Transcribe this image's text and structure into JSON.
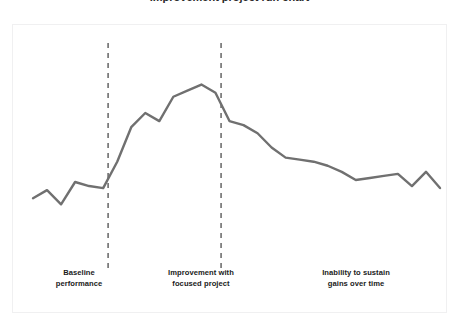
{
  "figure": {
    "background_color": "#ffffff",
    "panel_border_color": "#f0f0f1",
    "clipped_title": "Improvement project run chart"
  },
  "chart_data": {
    "type": "line",
    "title": "",
    "xlabel": "",
    "ylabel": "",
    "grid": false,
    "legend": false,
    "line_color": "#707070",
    "line_width": 2.4,
    "xlim": [
      0,
      29
    ],
    "ylim": [
      0,
      10
    ],
    "x": [
      0,
      1,
      2,
      3,
      4,
      5,
      6,
      7,
      8,
      9,
      10,
      11,
      12,
      13,
      14,
      15,
      16,
      17,
      18,
      19,
      20,
      21,
      22,
      23,
      24,
      25,
      26,
      27,
      28,
      29
    ],
    "values": [
      2.55,
      2.95,
      2.25,
      3.35,
      3.15,
      3.05,
      4.35,
      6.05,
      6.75,
      6.35,
      7.55,
      7.85,
      8.15,
      7.75,
      6.35,
      6.15,
      5.75,
      5.05,
      4.55,
      4.45,
      4.35,
      4.15,
      3.85,
      3.45,
      3.55,
      3.65,
      3.75,
      3.15,
      3.85,
      3.05
    ],
    "annotations": [
      {
        "name": "phase-divider-1",
        "type": "vertical-dashed-line",
        "x": 5.35,
        "color": "#4d4d4d"
      },
      {
        "name": "phase-divider-2",
        "type": "vertical-dashed-line",
        "x": 13.4,
        "color": "#4d4d4d"
      }
    ],
    "phases": [
      {
        "id": "baseline",
        "label": "Baseline\nperformance"
      },
      {
        "id": "improvement",
        "label": "Improvement with\nfocused project"
      },
      {
        "id": "regression",
        "label": "Inability to sustain\ngains over time"
      }
    ]
  }
}
